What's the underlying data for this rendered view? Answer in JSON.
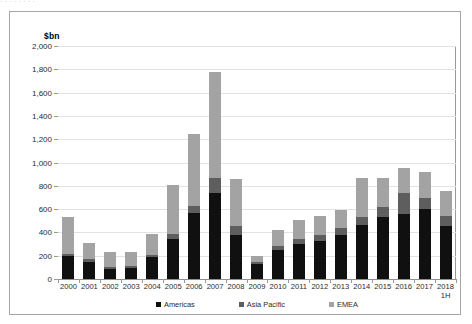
{
  "top_bleed_text": ". . .  . .        . .    .",
  "figure": {
    "unit_label": "$bn"
  },
  "chart_data": {
    "type": "bar",
    "stacked": true,
    "title": "",
    "subtitle": "",
    "xlabel": "",
    "ylabel": "$bn",
    "ylim": [
      0,
      2000
    ],
    "ytick_step": 200,
    "grid": true,
    "legend_position": "bottom",
    "yticks": [
      "0",
      "200",
      "400",
      "600",
      "800",
      "1,000",
      "1,200",
      "1,400",
      "1,600",
      "1,800",
      "2,000"
    ],
    "categories": [
      "2000",
      "2001",
      "2002",
      "2003",
      "2004",
      "2005",
      "2006",
      "2007",
      "2008",
      "2009",
      "2010",
      "2011",
      "2012",
      "2013",
      "2014",
      "2015",
      "2016",
      "2017",
      "2018\n1H"
    ],
    "series": [
      {
        "name": "Americas",
        "color": "#101010",
        "values": [
          195,
          150,
          85,
          95,
          185,
          345,
          570,
          740,
          380,
          130,
          245,
          300,
          325,
          375,
          460,
          530,
          560,
          600,
          455
        ]
      },
      {
        "name": "Asia Pacific",
        "color": "#5e5e5e",
        "values": [
          20,
          20,
          15,
          15,
          25,
          45,
          55,
          130,
          75,
          20,
          40,
          45,
          55,
          60,
          75,
          90,
          180,
          95,
          85
        ]
      },
      {
        "name": "EMEA",
        "color": "#a3a3a3",
        "values": [
          320,
          140,
          130,
          125,
          180,
          420,
          620,
          910,
          400,
          50,
          140,
          165,
          165,
          155,
          335,
          250,
          215,
          220,
          215
        ]
      }
    ],
    "totals": [
      535,
      310,
      230,
      235,
      390,
      810,
      1245,
      1780,
      855,
      200,
      425,
      510,
      545,
      590,
      870,
      870,
      955,
      915,
      755
    ]
  }
}
